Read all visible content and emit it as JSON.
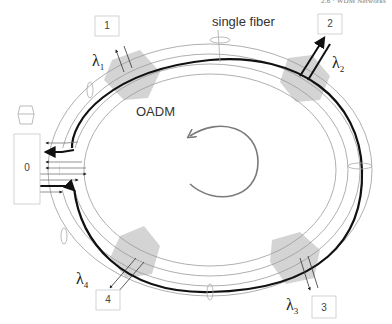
{
  "header": {
    "running_title": "2.6 · WDM Networks"
  },
  "diagram": {
    "type": "oadm-ring-network",
    "labels": {
      "fiber": "single fiber",
      "oadm": "OADM"
    },
    "direction": "counter-clockwise",
    "nodes": [
      {
        "id": "0",
        "label": "0",
        "role": "hub"
      },
      {
        "id": "1",
        "label": "1",
        "lambda": "λ",
        "lambda_sub": "1"
      },
      {
        "id": "2",
        "label": "2",
        "lambda": "λ",
        "lambda_sub": "2"
      },
      {
        "id": "3",
        "label": "3",
        "lambda": "λ",
        "lambda_sub": "3"
      },
      {
        "id": "4",
        "label": "4",
        "lambda": "λ",
        "lambda_sub": "4"
      }
    ],
    "colors": {
      "main_fiber": "#111111",
      "secondary_fiber": "#9a9a9a",
      "oadm_fill": "#d4d4d4",
      "rotation_arrow": "#7a7a7a",
      "box_border": "#c8c8c8"
    }
  }
}
